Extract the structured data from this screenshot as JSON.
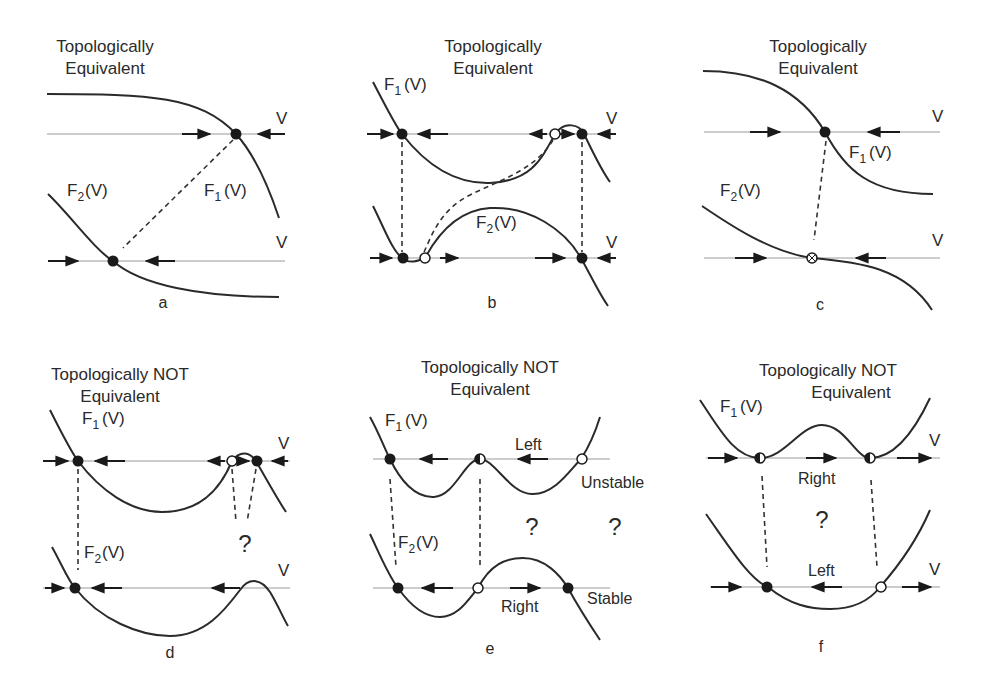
{
  "figure": {
    "panels": [
      {
        "id": "a",
        "caption": "a",
        "title_line1": "Topologically",
        "title_line2": "Equivalent",
        "f1": "F",
        "f1_sub": "1",
        "f2": "F",
        "f2_sub": "2",
        "arg": "(V)",
        "axis_label": "V"
      },
      {
        "id": "b",
        "caption": "b",
        "title_line1": "Topologically",
        "title_line2": "Equivalent",
        "f1": "F",
        "f1_sub": "1",
        "f2": "F",
        "f2_sub": "2",
        "arg": "(V)",
        "axis_label": "V"
      },
      {
        "id": "c",
        "caption": "c",
        "title_line1": "Topologically",
        "title_line2": "Equivalent",
        "f1": "F",
        "f1_sub": "1",
        "f2": "F",
        "f2_sub": "2",
        "arg": "(V)",
        "axis_label": "V"
      },
      {
        "id": "d",
        "caption": "d",
        "title_line1": "Topologically NOT",
        "title_line2": "Equivalent",
        "f1": "F",
        "f1_sub": "1",
        "f2": "F",
        "f2_sub": "2",
        "arg": "(V)",
        "axis_label": "V",
        "question": "?"
      },
      {
        "id": "e",
        "caption": "e",
        "title_line1": "Topologically NOT",
        "title_line2": "Equivalent",
        "f1": "F",
        "f1_sub": "1",
        "f2": "F",
        "f2_sub": "2",
        "arg": "(V)",
        "question": "?",
        "label_left": "Left",
        "label_right": "Right",
        "label_unstable": "Unstable",
        "label_stable": "Stable"
      },
      {
        "id": "f",
        "caption": "f",
        "title_line1": "Topologically NOT",
        "title_line2": "Equivalent",
        "f1": "F",
        "f1_sub": "1",
        "arg": "(V)",
        "axis_label": "V",
        "question": "?",
        "label_left": "Left",
        "label_right": "Right"
      }
    ]
  },
  "colors": {
    "ink": "#2a2a2a",
    "axis": "#9a9a9a",
    "background": "#ffffff"
  }
}
